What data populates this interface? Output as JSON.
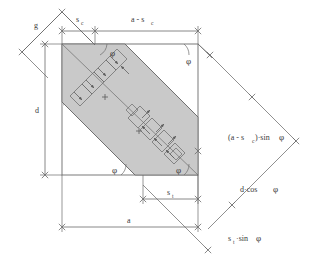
{
  "figure": {
    "type": "technical-dimension-diagram",
    "background_color": "#ffffff",
    "line_color": "#6b6b6b",
    "text_color": "#3a3a3a",
    "band_fill_color": "#c9c9c9",
    "square_side_label": "a"
  },
  "labels": {
    "gap": "g",
    "cut_width": "s",
    "cut_width_sub": "c",
    "remaining": "a - s",
    "remaining_sub": "c",
    "diagonal": "d",
    "side": "a",
    "tool_width": "s",
    "tool_width_sub": "t",
    "projected_remaining": "(a - s",
    "projected_remaining_sub": "c",
    "projected_remaining_tail": ")·sin",
    "projected_remaining_phi": "φ",
    "diagonal_projection": "d·cos",
    "diagonal_projection_phi": "φ",
    "tool_projection": "s",
    "tool_projection_sub": "t",
    "tool_projection_tail": "·sin",
    "tool_projection_phi": "φ",
    "angle_phi": "φ"
  },
  "angles": [
    {
      "name": "phi-top-left",
      "symbol": "φ"
    },
    {
      "name": "phi-top-right",
      "symbol": "φ"
    },
    {
      "name": "phi-bottom-left",
      "symbol": "φ"
    },
    {
      "name": "phi-bottom-right",
      "symbol": "φ"
    }
  ],
  "dimension_chains": [
    {
      "name": "top-chain",
      "segments": [
        "s_c",
        "a - s_c"
      ]
    },
    {
      "name": "left-chain",
      "segments": [
        "d"
      ]
    },
    {
      "name": "bottom-chain",
      "segments": [
        "a",
        "s_t"
      ]
    },
    {
      "name": "right-oblique-chain",
      "segments": [
        "(a - s_c)·sinφ",
        "d·cosφ",
        "s_t·sinφ"
      ]
    },
    {
      "name": "upper-left-oblique-chain",
      "segments": [
        "g"
      ]
    }
  ]
}
